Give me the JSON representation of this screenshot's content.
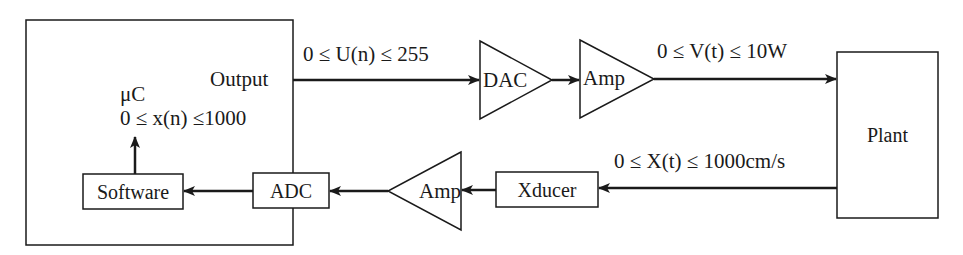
{
  "diagram": {
    "type": "block-diagram",
    "blocks": {
      "microcontroller": {
        "label": "μC",
        "range": "0 ≤ x(n) ≤1000",
        "output_label": "Output"
      },
      "software": {
        "label": "Software"
      },
      "adc": {
        "label": "ADC"
      },
      "dac": {
        "label": "DAC"
      },
      "amp_forward": {
        "label": "Amp"
      },
      "amp_feedback": {
        "label": "Amp"
      },
      "xducer": {
        "label": "Xducer"
      },
      "plant": {
        "label": "Plant"
      }
    },
    "signals": {
      "u": "0 ≤ U(n) ≤ 255",
      "v": "0 ≤ V(t) ≤ 10W",
      "x": "0 ≤ X(t) ≤ 1000cm/s"
    },
    "connections": [
      {
        "from": "microcontroller.output",
        "to": "dac",
        "signal": "u"
      },
      {
        "from": "dac",
        "to": "amp_forward"
      },
      {
        "from": "amp_forward",
        "to": "plant",
        "signal": "v"
      },
      {
        "from": "plant",
        "to": "xducer",
        "signal": "x"
      },
      {
        "from": "xducer",
        "to": "amp_feedback"
      },
      {
        "from": "amp_feedback",
        "to": "adc"
      },
      {
        "from": "adc",
        "to": "software"
      },
      {
        "from": "software",
        "to": "microcontroller"
      }
    ],
    "colors": {
      "stroke": "#1a1a1a",
      "background": "#ffffff"
    }
  }
}
